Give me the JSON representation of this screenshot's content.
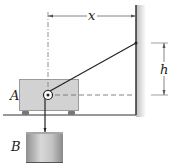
{
  "figure": {
    "labels": {
      "block_a": "A",
      "block_b": "B",
      "horizontal_distance": "x",
      "vertical_distance": "h"
    },
    "elements": {
      "block_a": {
        "type": "cart",
        "wheels": 2,
        "has_pulley": true
      },
      "block_b": {
        "type": "cylinder",
        "hanging": true
      },
      "wall": {
        "type": "vertical wall with shading"
      },
      "floor": {
        "type": "horizontal ground line"
      },
      "cable": {
        "from": "wall attachment point",
        "over": "pulley on A",
        "to": "block B"
      }
    },
    "colors": {
      "block_a_fill": "#d2d2d2",
      "block_b_fill": "#b8b8b8",
      "line": "#222222",
      "dimension_line": "#666666"
    }
  }
}
